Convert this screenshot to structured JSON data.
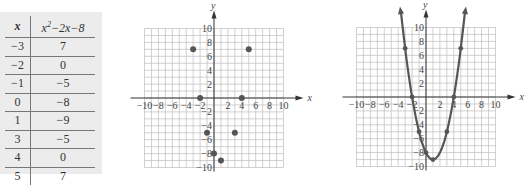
{
  "table": {
    "headers": [
      "x",
      "x²−2x−8"
    ],
    "rows": [
      [
        "−3",
        "7"
      ],
      [
        "−2",
        "0"
      ],
      [
        "−1",
        "−5"
      ],
      [
        "0",
        "−8"
      ],
      [
        "1",
        "−9"
      ],
      [
        "3",
        "−5"
      ],
      [
        "4",
        "0"
      ],
      [
        "5",
        "7"
      ]
    ]
  },
  "chart_data": [
    {
      "type": "table",
      "columns": [
        "x",
        "x^2-2x-8"
      ],
      "rows": [
        [
          -3,
          7
        ],
        [
          -2,
          0
        ],
        [
          -1,
          -5
        ],
        [
          0,
          -8
        ],
        [
          1,
          -9
        ],
        [
          3,
          -5
        ],
        [
          4,
          0
        ],
        [
          5,
          7
        ]
      ]
    },
    {
      "type": "scatter",
      "title": "",
      "xlabel": "x",
      "ylabel": "y",
      "x": [
        -3,
        -2,
        -1,
        0,
        1,
        3,
        4,
        5
      ],
      "y": [
        7,
        0,
        -5,
        -8,
        -9,
        -5,
        0,
        7
      ],
      "xlim": [
        -10,
        10
      ],
      "ylim": [
        -10,
        10
      ],
      "xticks": [
        "−10",
        "−8",
        "−6",
        "−4",
        "−2",
        "2",
        "4",
        "6",
        "8",
        "10"
      ],
      "yticks": [
        "10",
        "8",
        "6",
        "4",
        "2",
        "−2",
        "−4",
        "−6",
        "−8",
        "−10"
      ],
      "grid": true
    },
    {
      "type": "line",
      "title": "",
      "function": "y = x^2 - 2x - 8",
      "xlabel": "x",
      "ylabel": "y",
      "points": {
        "x": [
          -3,
          -2,
          -1,
          0,
          1,
          3,
          4,
          5
        ],
        "y": [
          7,
          0,
          -5,
          -8,
          -9,
          -5,
          0,
          7
        ]
      },
      "xlim": [
        -10,
        10
      ],
      "ylim": [
        -10,
        10
      ],
      "xticks": [
        "−10",
        "−8",
        "−6",
        "−4",
        "−2",
        "2",
        "4",
        "6",
        "8",
        "10"
      ],
      "yticks": [
        "10",
        "8",
        "6",
        "4",
        "2",
        "−2",
        "−4",
        "−6",
        "−8",
        "−10"
      ],
      "grid": true
    }
  ],
  "labels": {
    "x_axis": "x",
    "y_axis": "y"
  },
  "colors": {
    "grid": "#bdbdbd",
    "axis": "#333333",
    "point": "#555555",
    "curve": "#555555",
    "table_bg": "#ececec"
  }
}
